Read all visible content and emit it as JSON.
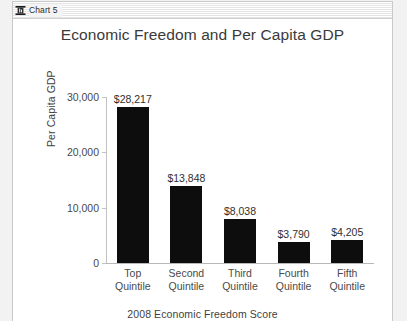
{
  "window": {
    "title": "Chart 5",
    "icon": "chart-document-icon"
  },
  "chart_data": {
    "type": "bar",
    "title": "Economic Freedom and Per Capita GDP",
    "xlabel": "2008 Economic Freedom Score",
    "ylabel": "Per Capita GDP",
    "categories": [
      "Top\nQuintile",
      "Second\nQuintile",
      "Third\nQuintile",
      "Fourth\nQuintile",
      "Fifth\nQuintile"
    ],
    "category_lines": [
      [
        "Top",
        "Quintile"
      ],
      [
        "Second",
        "Quintile"
      ],
      [
        "Third",
        "Quintile"
      ],
      [
        "Fourth",
        "Quintile"
      ],
      [
        "Fifth",
        "Quintile"
      ]
    ],
    "values": [
      28217,
      13848,
      8038,
      3790,
      4205
    ],
    "data_labels": [
      "$28,217",
      "$13,848",
      "$8,038",
      "$3,790",
      "$4,205"
    ],
    "ylim": [
      0,
      30000
    ],
    "yticks": [
      0,
      10000,
      20000,
      30000
    ],
    "ytick_labels": [
      "0",
      "10,000",
      "20,000",
      "30,000"
    ],
    "grid": false,
    "legend": null,
    "bar_color": "#0d0d0d"
  }
}
